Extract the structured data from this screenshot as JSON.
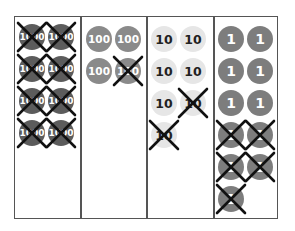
{
  "chart_data": {
    "type": "diagram",
    "title": "",
    "columns": [
      {
        "place": "thousands",
        "label": "1000",
        "total_disks": 8,
        "crossed": 8
      },
      {
        "place": "hundreds",
        "label": "100",
        "total_disks": 4,
        "crossed": 1
      },
      {
        "place": "tens",
        "label": "10",
        "total_disks": 7,
        "crossed": 2
      },
      {
        "place": "ones",
        "label": "1",
        "total_disks": 11,
        "crossed": 5
      }
    ]
  },
  "disks": [
    {
      "label": "1000",
      "cls": "d1000",
      "x": 19,
      "y": 24,
      "crossed": true
    },
    {
      "label": "1000",
      "cls": "d1000",
      "x": 48,
      "y": 24,
      "crossed": true
    },
    {
      "label": "1000",
      "cls": "d1000",
      "x": 19,
      "y": 56,
      "crossed": true
    },
    {
      "label": "1000",
      "cls": "d1000",
      "x": 48,
      "y": 56,
      "crossed": true
    },
    {
      "label": "1000",
      "cls": "d1000",
      "x": 19,
      "y": 88,
      "crossed": true
    },
    {
      "label": "1000",
      "cls": "d1000",
      "x": 48,
      "y": 88,
      "crossed": true
    },
    {
      "label": "1000",
      "cls": "d1000",
      "x": 19,
      "y": 120,
      "crossed": true
    },
    {
      "label": "1000",
      "cls": "d1000",
      "x": 48,
      "y": 120,
      "crossed": true
    },
    {
      "label": "100",
      "cls": "d100",
      "x": 86,
      "y": 26,
      "crossed": false
    },
    {
      "label": "100",
      "cls": "d100",
      "x": 115,
      "y": 26,
      "crossed": false
    },
    {
      "label": "100",
      "cls": "d100",
      "x": 86,
      "y": 58,
      "crossed": false
    },
    {
      "label": "100",
      "cls": "d100",
      "x": 115,
      "y": 58,
      "crossed": true
    },
    {
      "label": "10",
      "cls": "d10",
      "x": 151,
      "y": 26,
      "crossed": false
    },
    {
      "label": "10",
      "cls": "d10",
      "x": 180,
      "y": 26,
      "crossed": false
    },
    {
      "label": "10",
      "cls": "d10",
      "x": 151,
      "y": 58,
      "crossed": false
    },
    {
      "label": "10",
      "cls": "d10",
      "x": 180,
      "y": 58,
      "crossed": false
    },
    {
      "label": "10",
      "cls": "d10",
      "x": 151,
      "y": 90,
      "crossed": false
    },
    {
      "label": "10",
      "cls": "d10",
      "x": 180,
      "y": 90,
      "crossed": true
    },
    {
      "label": "10",
      "cls": "d10",
      "x": 151,
      "y": 122,
      "crossed": true
    },
    {
      "label": "1",
      "cls": "d1",
      "x": 218,
      "y": 26,
      "crossed": false
    },
    {
      "label": "1",
      "cls": "d1",
      "x": 247,
      "y": 26,
      "crossed": false
    },
    {
      "label": "1",
      "cls": "d1",
      "x": 218,
      "y": 58,
      "crossed": false
    },
    {
      "label": "1",
      "cls": "d1",
      "x": 247,
      "y": 58,
      "crossed": false
    },
    {
      "label": "1",
      "cls": "d1",
      "x": 218,
      "y": 90,
      "crossed": false
    },
    {
      "label": "1",
      "cls": "d1",
      "x": 247,
      "y": 90,
      "crossed": false
    },
    {
      "label": "1",
      "cls": "d1",
      "x": 218,
      "y": 122,
      "crossed": true
    },
    {
      "label": "1",
      "cls": "d1",
      "x": 247,
      "y": 122,
      "crossed": true
    },
    {
      "label": "1",
      "cls": "d1",
      "x": 218,
      "y": 154,
      "crossed": true
    },
    {
      "label": "1",
      "cls": "d1",
      "x": 247,
      "y": 154,
      "crossed": true
    },
    {
      "label": "1",
      "cls": "d1",
      "x": 218,
      "y": 186,
      "crossed": true
    }
  ],
  "colors": {
    "border": "#555555",
    "thousands": "#5c5c5c",
    "hundreds": "#8a8a8a",
    "tens": "#e6e6e6",
    "ones": "#7d7d7d",
    "cross": "#111111"
  }
}
